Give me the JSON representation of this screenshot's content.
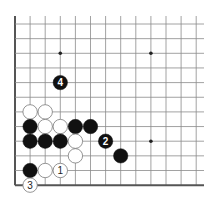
{
  "diagram": {
    "type": "go-board-fragment",
    "view": "lower-left corner",
    "grid": {
      "columns": 13,
      "rows": 12,
      "x0": 15,
      "y0": 24,
      "dx": 15.1,
      "dy": 14.65,
      "left_edge": true,
      "bottom_edge": true,
      "top_extends_to": 16,
      "right_extends_to": 204
    },
    "colors": {
      "line": "#8a8a8a",
      "edge": "#555555",
      "black_stone": "#111111",
      "white_stone": "#ffffff",
      "white_outline": "#7a7a7a",
      "star": "#222222"
    },
    "star_points": [
      {
        "col": 3,
        "row": 2
      },
      {
        "col": 9,
        "row": 2
      },
      {
        "col": 9,
        "row": 8
      }
    ],
    "stones": [
      {
        "color": "white",
        "col": 1,
        "row": 6,
        "label": ""
      },
      {
        "color": "white",
        "col": 2,
        "row": 6,
        "label": ""
      },
      {
        "color": "black",
        "col": 1,
        "row": 7,
        "label": ""
      },
      {
        "color": "white",
        "col": 2,
        "row": 7,
        "label": ""
      },
      {
        "color": "white",
        "col": 3,
        "row": 7,
        "label": ""
      },
      {
        "color": "black",
        "col": 4,
        "row": 7,
        "label": ""
      },
      {
        "color": "black",
        "col": 5,
        "row": 7,
        "label": ""
      },
      {
        "color": "black",
        "col": 1,
        "row": 8,
        "label": ""
      },
      {
        "color": "black",
        "col": 2,
        "row": 8,
        "label": ""
      },
      {
        "color": "black",
        "col": 3,
        "row": 8,
        "label": ""
      },
      {
        "color": "white",
        "col": 4,
        "row": 8,
        "label": ""
      },
      {
        "color": "black",
        "col": 6,
        "row": 8,
        "label": "2"
      },
      {
        "color": "white",
        "col": 4,
        "row": 9,
        "label": ""
      },
      {
        "color": "black",
        "col": 7,
        "row": 9,
        "label": ""
      },
      {
        "color": "black",
        "col": 1,
        "row": 10,
        "label": ""
      },
      {
        "color": "white",
        "col": 2,
        "row": 10,
        "label": ""
      },
      {
        "color": "white",
        "col": 3,
        "row": 10,
        "label": "1"
      },
      {
        "color": "white",
        "col": 1,
        "row": 11,
        "label": "3"
      },
      {
        "color": "black",
        "col": 3,
        "row": 4,
        "label": "4"
      }
    ]
  }
}
